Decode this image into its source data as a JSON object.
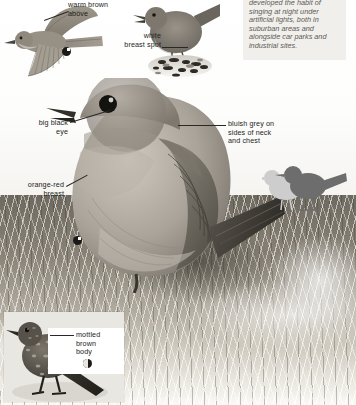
{
  "intro": {
    "text": "developed the habit of singing at night under artificial lights, both in suburban areas and alongside car parks and industrial sites."
  },
  "labels": [
    {
      "id": "warm-brown-above",
      "line1": "warm brown",
      "line2": "above",
      "line3": ""
    },
    {
      "id": "white-breast-spot",
      "line1": "white",
      "line2": "breast spot",
      "line3": ""
    },
    {
      "id": "big-black-eye",
      "line1": "big black",
      "line2": "eye",
      "line3": ""
    },
    {
      "id": "orange-red-breast",
      "line1": "orange-red",
      "line2": "breast",
      "line3": ""
    },
    {
      "id": "bluish-grey",
      "line1": "bluish grey on",
      "line2": "sides of neck",
      "line3": "and chest"
    },
    {
      "id": "mottled-brown-body",
      "line1": "mottled",
      "line2": "brown",
      "line3": "body"
    }
  ],
  "figures": [
    {
      "id": "flying-bird",
      "caption": "bird in flight illustration"
    },
    {
      "id": "nightingale",
      "caption": "small brown bird on gravel"
    },
    {
      "id": "main-robin",
      "caption": "adult robin perched"
    },
    {
      "id": "silhouette-pair",
      "caption": "two small bird silhouettes"
    },
    {
      "id": "juvenile-robin",
      "caption": "juvenile robin inset photo"
    }
  ],
  "icons": [
    {
      "id": "pie-icon-flight",
      "name": "pie-chart-icon"
    },
    {
      "id": "pie-icon-robin",
      "name": "pie-chart-icon"
    },
    {
      "id": "pie-icon-juvenile",
      "name": "pie-chart-icon"
    }
  ],
  "colors": {
    "label_text": "#231f1c",
    "intro_text": "#5e5a55",
    "intro_bg": "#f0efec",
    "leader_line": "#2a2724",
    "silhouette_dark": "#6b6b6b",
    "silhouette_light": "#cfcfcf",
    "page_bg": "#ffffff"
  }
}
